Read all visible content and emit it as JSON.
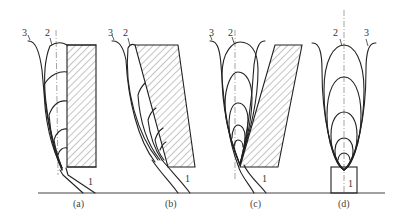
{
  "figure": {
    "type": "technical-diagram",
    "line_color": "#222222",
    "hatch_color": "#555555",
    "background": "#ffffff"
  },
  "panels": [
    {
      "id": "a",
      "caption": "(a)",
      "labels": {
        "curve3": "3",
        "curve2": "2",
        "part1": "1"
      }
    },
    {
      "id": "b",
      "caption": "(b)",
      "labels": {
        "curve3": "3",
        "curve2": "2",
        "part1": "1"
      }
    },
    {
      "id": "c",
      "caption": "(c)",
      "labels": {
        "curve3": "3",
        "curve2": "2",
        "part1": "1"
      }
    },
    {
      "id": "d",
      "caption": "(d)",
      "labels": {
        "curve2": "2",
        "curve3": "3",
        "part1": "1"
      }
    }
  ]
}
